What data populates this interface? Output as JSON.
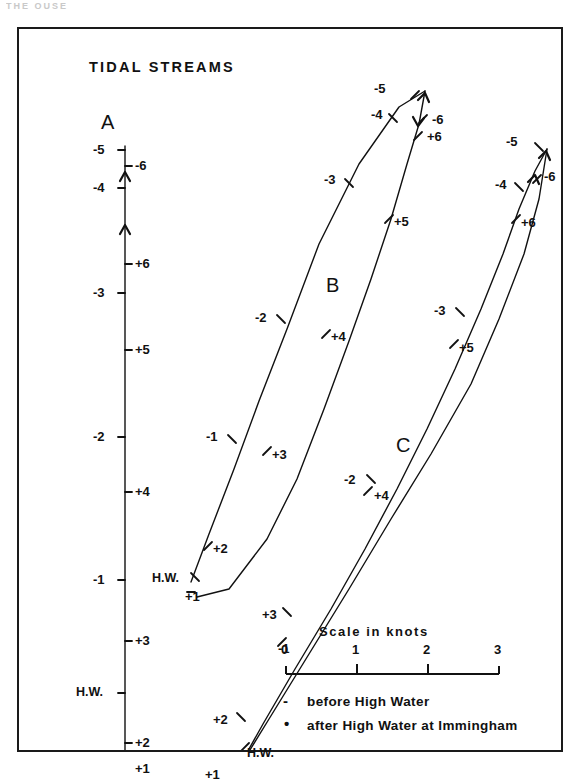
{
  "figure": {
    "title": "TIDAL STREAMS",
    "top_fragment": "THE OUSE",
    "frame_color": "#1a1a1a",
    "line_color": "#111111",
    "background": "#ffffff"
  },
  "scale": {
    "caption": "Scale in knots",
    "ticks": [
      "0",
      "1",
      "2",
      "3"
    ],
    "unit": "knots",
    "min": 0,
    "max": 3
  },
  "legend": {
    "entries": [
      {
        "symbol": "-",
        "symbol_name": "minus-sign",
        "text": "before High Water"
      },
      {
        "symbol": "•",
        "symbol_name": "dot-sign",
        "text": "after High Water at Immingham"
      }
    ]
  },
  "stations": [
    {
      "id": "A",
      "label": "A",
      "label_x": 82,
      "label_y": 82,
      "description": "Station A tidal stream curve - near vertical, negligible lateral flow",
      "path": [
        [
          106,
          117
        ],
        [
          106,
          195
        ],
        [
          106,
          260
        ],
        [
          106,
          330
        ],
        [
          106,
          420
        ],
        [
          106,
          500
        ],
        [
          106,
          560
        ],
        [
          106,
          640
        ],
        [
          106,
          700
        ],
        [
          106,
          745
        ]
      ],
      "arrows": [
        {
          "x": 106,
          "y": 196,
          "dir": "up"
        },
        {
          "x": 106,
          "y": 143,
          "dir": "up"
        }
      ],
      "points": [
        {
          "hour": "-5",
          "label": "-5",
          "px": 106,
          "py": 121,
          "lx": 74,
          "ly": 113,
          "tick": "left"
        },
        {
          "hour": "-6",
          "label": "-6",
          "px": 106,
          "py": 137,
          "lx": 116,
          "ly": 129,
          "tick": "right"
        },
        {
          "hour": "-4",
          "label": "-4",
          "px": 106,
          "py": 159,
          "lx": 74,
          "ly": 151,
          "tick": "left"
        },
        {
          "hour": "+6",
          "label": "+6",
          "px": 106,
          "py": 235,
          "lx": 116,
          "ly": 227,
          "tick": "right"
        },
        {
          "hour": "-3",
          "label": "-3",
          "px": 106,
          "py": 264,
          "lx": 74,
          "ly": 256,
          "tick": "left"
        },
        {
          "hour": "+5",
          "label": "+5",
          "px": 106,
          "py": 321,
          "lx": 116,
          "ly": 313,
          "tick": "right"
        },
        {
          "hour": "-2",
          "label": "-2",
          "px": 106,
          "py": 408,
          "lx": 74,
          "ly": 400,
          "tick": "left"
        },
        {
          "hour": "+4",
          "label": "+4",
          "px": 106,
          "py": 463,
          "lx": 116,
          "ly": 455,
          "tick": "right"
        },
        {
          "hour": "-1",
          "label": "-1",
          "px": 106,
          "py": 551,
          "lx": 74,
          "ly": 543,
          "tick": "left"
        },
        {
          "hour": "+3",
          "label": "+3",
          "px": 106,
          "py": 612,
          "lx": 116,
          "ly": 604,
          "tick": "right"
        },
        {
          "hour": "H.W.",
          "label": "H.W.",
          "px": 106,
          "py": 664,
          "lx": 57,
          "ly": 656,
          "tick": "left"
        },
        {
          "hour": "+2",
          "label": "+2",
          "px": 106,
          "py": 714,
          "lx": 116,
          "ly": 706,
          "tick": "right"
        },
        {
          "hour": "+1",
          "label": "+1",
          "px": 106,
          "py": 740,
          "lx": 116,
          "ly": 732,
          "tick": "right"
        }
      ]
    },
    {
      "id": "B",
      "label": "B",
      "label_x": 307,
      "label_y": 245,
      "description": "Station B tidal stream curve - narrow elongated loop, flow to NNE",
      "outbound": [
        [
          172,
          553
        ],
        [
          190,
          505
        ],
        [
          215,
          440
        ],
        [
          240,
          372
        ],
        [
          268,
          300
        ],
        [
          300,
          215
        ],
        [
          340,
          135
        ],
        [
          380,
          78
        ],
        [
          406,
          62
        ]
      ],
      "inbound": [
        [
          406,
          62
        ],
        [
          400,
          95
        ],
        [
          388,
          135
        ],
        [
          372,
          190
        ],
        [
          352,
          250
        ],
        [
          330,
          312
        ],
        [
          305,
          380
        ],
        [
          278,
          450
        ],
        [
          248,
          510
        ],
        [
          210,
          560
        ],
        [
          178,
          568
        ]
      ],
      "arrows": [
        {
          "x": 406,
          "y": 64,
          "dir": "up-right"
        },
        {
          "x": 399,
          "y": 97,
          "dir": "down-left"
        }
      ],
      "points": [
        {
          "hour": "-5",
          "label": "-5",
          "px": 396,
          "py": 66,
          "lx": 355,
          "ly": 52,
          "tick": "ne"
        },
        {
          "hour": "-6",
          "label": "-6",
          "px": 404,
          "py": 90,
          "lx": 413,
          "ly": 83,
          "tick": "e"
        },
        {
          "hour": "+6",
          "label": "+6",
          "px": 399,
          "py": 107,
          "lx": 408,
          "ly": 100,
          "tick": "e"
        },
        {
          "hour": "-4",
          "label": "-4",
          "px": 374,
          "py": 89,
          "lx": 352,
          "ly": 78,
          "tick": "w"
        },
        {
          "hour": "-3",
          "label": "-3",
          "px": 330,
          "py": 154,
          "lx": 305,
          "ly": 143,
          "tick": "w"
        },
        {
          "hour": "+5",
          "label": "+5",
          "px": 370,
          "py": 190,
          "lx": 375,
          "ly": 185,
          "tick": "e"
        },
        {
          "hour": "-2",
          "label": "-2",
          "px": 262,
          "py": 290,
          "lx": 236,
          "ly": 281,
          "tick": "w"
        },
        {
          "hour": "+4",
          "label": "+4",
          "px": 307,
          "py": 305,
          "lx": 312,
          "ly": 300,
          "tick": "e"
        },
        {
          "hour": "-1",
          "label": "-1",
          "px": 213,
          "py": 410,
          "lx": 187,
          "ly": 400,
          "tick": "w"
        },
        {
          "hour": "+3",
          "label": "+3",
          "px": 248,
          "py": 422,
          "lx": 253,
          "ly": 418,
          "tick": "e"
        },
        {
          "hour": "+2",
          "label": "+2",
          "px": 189,
          "py": 517,
          "lx": 194,
          "ly": 512,
          "tick": "e"
        },
        {
          "hour": "H.W.",
          "label": "H.W.",
          "px": 176,
          "py": 548,
          "lx": 133,
          "ly": 542,
          "tick": "w"
        },
        {
          "hour": "+1",
          "label": "+1",
          "px": 172,
          "py": 563,
          "lx": 166,
          "ly": 560,
          "tick": "s"
        }
      ]
    },
    {
      "id": "C",
      "label": "C",
      "label_x": 377,
      "label_y": 405,
      "description": "Station C tidal stream curve - very narrow loop, flow to NNE",
      "outbound": [
        [
          218,
          742
        ],
        [
          250,
          690
        ],
        [
          290,
          625
        ],
        [
          330,
          560
        ],
        [
          372,
          490
        ],
        [
          412,
          425
        ],
        [
          452,
          355
        ],
        [
          480,
          290
        ],
        [
          505,
          225
        ],
        [
          520,
          170
        ],
        [
          528,
          120
        ]
      ],
      "inbound": [
        [
          528,
          120
        ],
        [
          516,
          142
        ],
        [
          500,
          180
        ],
        [
          484,
          225
        ],
        [
          462,
          280
        ],
        [
          436,
          340
        ],
        [
          408,
          400
        ],
        [
          378,
          460
        ],
        [
          346,
          520
        ],
        [
          312,
          580
        ],
        [
          276,
          640
        ],
        [
          244,
          695
        ],
        [
          216,
          745
        ]
      ],
      "arrows": [
        {
          "x": 527,
          "y": 122,
          "dir": "up-right"
        },
        {
          "x": 516,
          "y": 146,
          "dir": "up-right"
        }
      ],
      "points": [
        {
          "hour": "-5",
          "label": "-5",
          "px": 520,
          "py": 118,
          "lx": 487,
          "ly": 105,
          "tick": "nw"
        },
        {
          "hour": "-6",
          "label": "-6",
          "px": 518,
          "py": 150,
          "lx": 525,
          "ly": 140,
          "tick": "e"
        },
        {
          "hour": "-4",
          "label": "-4",
          "px": 500,
          "py": 158,
          "lx": 476,
          "ly": 148,
          "tick": "w"
        },
        {
          "hour": "+6",
          "label": "+6",
          "px": 497,
          "py": 190,
          "lx": 502,
          "ly": 186,
          "tick": "e"
        },
        {
          "hour": "-3",
          "label": "-3",
          "px": 441,
          "py": 283,
          "lx": 415,
          "ly": 274,
          "tick": "w"
        },
        {
          "hour": "+5",
          "label": "+5",
          "px": 435,
          "py": 315,
          "lx": 440,
          "ly": 311,
          "tick": "e"
        },
        {
          "hour": "-2",
          "label": "-2",
          "px": 352,
          "py": 450,
          "lx": 325,
          "ly": 443,
          "tick": "w"
        },
        {
          "hour": "+4",
          "label": "+4",
          "px": 349,
          "py": 462,
          "lx": 355,
          "ly": 459,
          "tick": "e"
        },
        {
          "hour": "+3",
          "label": "+3",
          "px": 268,
          "py": 583,
          "lx": 243,
          "ly": 578,
          "tick": "w"
        },
        {
          "hour": "-1",
          "label": "-1",
          "px": 263,
          "py": 613,
          "lx": 259,
          "ly": 612,
          "tick": "e"
        },
        {
          "hour": "+2",
          "label": "+2",
          "px": 222,
          "py": 688,
          "lx": 194,
          "ly": 683,
          "tick": "w"
        },
        {
          "hour": "H.W.",
          "label": "H.W.",
          "px": 226,
          "py": 718,
          "lx": 228,
          "ly": 717,
          "tick": "e"
        },
        {
          "hour": "+1",
          "label": "+1",
          "px": 218,
          "py": 742,
          "lx": 186,
          "ly": 738,
          "tick": "w"
        }
      ]
    }
  ],
  "chart_data": {
    "type": "line",
    "title": "TIDAL STREAMS",
    "xlabel": "Scale in knots (East-West component)",
    "ylabel": "Scale in knots (North-South component)",
    "legend_position": "bottom-right",
    "grid": false,
    "series": [
      {
        "name": "A",
        "hours": [
          "-5",
          "-6",
          "-4",
          "+6",
          "-3",
          "+5",
          "-2",
          "+4",
          "-1",
          "+3",
          "H.W.",
          "+2",
          "+1"
        ]
      },
      {
        "name": "B",
        "hours": [
          "-5",
          "-6",
          "+6",
          "-4",
          "-3",
          "+5",
          "-2",
          "+4",
          "-1",
          "+3",
          "+2",
          "H.W.",
          "+1"
        ]
      },
      {
        "name": "C",
        "hours": [
          "-5",
          "-6",
          "-4",
          "+6",
          "-3",
          "+5",
          "-2",
          "+4",
          "+3",
          "-1",
          "+2",
          "H.W.",
          "+1"
        ]
      }
    ]
  }
}
